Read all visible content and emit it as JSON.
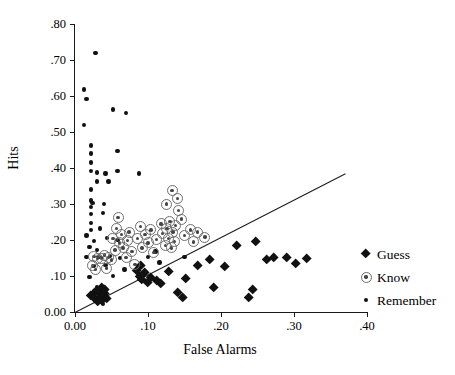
{
  "chart_data": {
    "type": "scatter",
    "title": "",
    "xlabel": "False Alarms",
    "ylabel": "Hits",
    "xlim": [
      0.0,
      0.4
    ],
    "ylim": [
      0.0,
      0.8
    ],
    "xticks": [
      0.0,
      0.1,
      0.2,
      0.3,
      0.4
    ],
    "xticklabels": [
      "0.00",
      ".10",
      ".20",
      ".30",
      ".40"
    ],
    "yticks": [
      0.0,
      0.1,
      0.2,
      0.3,
      0.4,
      0.5,
      0.6,
      0.7,
      0.8
    ],
    "yticklabels": [
      "0.00",
      ".10",
      ".20",
      ".30",
      ".40",
      ".50",
      ".60",
      ".70",
      ".80"
    ],
    "grid": false,
    "legend_position": "right",
    "reference_line": {
      "name": "identity-line",
      "x0": 0.0,
      "y0": 0.0,
      "x1": 0.37,
      "y1": 0.385
    },
    "series": [
      {
        "name": "Guess",
        "marker": "filled-diamond",
        "color": "#111111",
        "points": [
          [
            0.022,
            0.045
          ],
          [
            0.026,
            0.052
          ],
          [
            0.027,
            0.038
          ],
          [
            0.03,
            0.06
          ],
          [
            0.031,
            0.03
          ],
          [
            0.034,
            0.055
          ],
          [
            0.035,
            0.042
          ],
          [
            0.036,
            0.068
          ],
          [
            0.037,
            0.031
          ],
          [
            0.04,
            0.05
          ],
          [
            0.041,
            0.062
          ],
          [
            0.043,
            0.036
          ],
          [
            0.085,
            0.115
          ],
          [
            0.088,
            0.098
          ],
          [
            0.09,
            0.128
          ],
          [
            0.092,
            0.09
          ],
          [
            0.095,
            0.11
          ],
          [
            0.1,
            0.082
          ],
          [
            0.104,
            0.095
          ],
          [
            0.112,
            0.088
          ],
          [
            0.118,
            0.078
          ],
          [
            0.128,
            0.112
          ],
          [
            0.14,
            0.055
          ],
          [
            0.148,
            0.04
          ],
          [
            0.152,
            0.092
          ],
          [
            0.168,
            0.13
          ],
          [
            0.185,
            0.145
          ],
          [
            0.19,
            0.068
          ],
          [
            0.205,
            0.125
          ],
          [
            0.222,
            0.185
          ],
          [
            0.238,
            0.04
          ],
          [
            0.243,
            0.062
          ],
          [
            0.248,
            0.195
          ],
          [
            0.262,
            0.145
          ],
          [
            0.272,
            0.152
          ],
          [
            0.29,
            0.152
          ],
          [
            0.302,
            0.135
          ],
          [
            0.318,
            0.148
          ]
        ]
      },
      {
        "name": "Know",
        "marker": "circled-dot",
        "color": "#6e6e6e",
        "points": [
          [
            0.024,
            0.128
          ],
          [
            0.026,
            0.155
          ],
          [
            0.028,
            0.118
          ],
          [
            0.031,
            0.148
          ],
          [
            0.036,
            0.15
          ],
          [
            0.04,
            0.158
          ],
          [
            0.043,
            0.122
          ],
          [
            0.046,
            0.152
          ],
          [
            0.05,
            0.145
          ],
          [
            0.052,
            0.205
          ],
          [
            0.055,
            0.172
          ],
          [
            0.057,
            0.232
          ],
          [
            0.059,
            0.262
          ],
          [
            0.061,
            0.192
          ],
          [
            0.064,
            0.215
          ],
          [
            0.066,
            0.178
          ],
          [
            0.07,
            0.152
          ],
          [
            0.072,
            0.198
          ],
          [
            0.074,
            0.222
          ],
          [
            0.078,
            0.168
          ],
          [
            0.082,
            0.132
          ],
          [
            0.086,
            0.205
          ],
          [
            0.09,
            0.238
          ],
          [
            0.092,
            0.178
          ],
          [
            0.096,
            0.215
          ],
          [
            0.1,
            0.192
          ],
          [
            0.104,
            0.228
          ],
          [
            0.108,
            0.165
          ],
          [
            0.112,
            0.202
          ],
          [
            0.118,
            0.245
          ],
          [
            0.12,
            0.218
          ],
          [
            0.124,
            0.185
          ],
          [
            0.126,
            0.232
          ],
          [
            0.128,
            0.205
          ],
          [
            0.13,
            0.252
          ],
          [
            0.132,
            0.178
          ],
          [
            0.134,
            0.222
          ],
          [
            0.136,
            0.196
          ],
          [
            0.138,
            0.24
          ],
          [
            0.125,
            0.3
          ],
          [
            0.133,
            0.338
          ],
          [
            0.14,
            0.315
          ],
          [
            0.142,
            0.282
          ],
          [
            0.146,
            0.258
          ],
          [
            0.15,
            0.212
          ],
          [
            0.158,
            0.228
          ],
          [
            0.162,
            0.195
          ],
          [
            0.168,
            0.222
          ],
          [
            0.178,
            0.208
          ]
        ]
      },
      {
        "name": "Remember",
        "marker": "small-dot",
        "color": "#111111",
        "points": [
          [
            0.028,
            0.72
          ],
          [
            0.012,
            0.618
          ],
          [
            0.016,
            0.592
          ],
          [
            0.052,
            0.562
          ],
          [
            0.07,
            0.552
          ],
          [
            0.012,
            0.52
          ],
          [
            0.022,
            0.462
          ],
          [
            0.022,
            0.44
          ],
          [
            0.058,
            0.448
          ],
          [
            0.022,
            0.415
          ],
          [
            0.022,
            0.392
          ],
          [
            0.03,
            0.388
          ],
          [
            0.042,
            0.385
          ],
          [
            0.058,
            0.392
          ],
          [
            0.088,
            0.385
          ],
          [
            0.03,
            0.362
          ],
          [
            0.046,
            0.362
          ],
          [
            0.022,
            0.34
          ],
          [
            0.022,
            0.31
          ],
          [
            0.024,
            0.302
          ],
          [
            0.022,
            0.292
          ],
          [
            0.04,
            0.3
          ],
          [
            0.022,
            0.272
          ],
          [
            0.038,
            0.275
          ],
          [
            0.022,
            0.248
          ],
          [
            0.022,
            0.228
          ],
          [
            0.034,
            0.232
          ],
          [
            0.016,
            0.212
          ],
          [
            0.026,
            0.198
          ],
          [
            0.044,
            0.205
          ],
          [
            0.058,
            0.2
          ],
          [
            0.02,
            0.18
          ],
          [
            0.03,
            0.172
          ],
          [
            0.016,
            0.152
          ],
          [
            0.032,
            0.152
          ],
          [
            0.048,
            0.155
          ],
          [
            0.062,
            0.15
          ],
          [
            0.026,
            0.128
          ],
          [
            0.042,
            0.13
          ],
          [
            0.068,
            0.118
          ],
          [
            0.086,
            0.122
          ],
          [
            0.02,
            0.098
          ],
          [
            0.052,
            0.1
          ],
          [
            0.03,
            0.07
          ],
          [
            0.026,
            0.05
          ],
          [
            0.034,
            0.048
          ],
          [
            0.028,
            0.036
          ],
          [
            0.036,
            0.032
          ],
          [
            0.042,
            0.038
          ],
          [
            0.038,
            0.022
          ],
          [
            0.11,
            0.168
          ],
          [
            0.1,
            0.152
          ],
          [
            0.116,
            0.138
          ],
          [
            0.15,
            0.152
          ]
        ]
      }
    ]
  },
  "legend": {
    "items": [
      {
        "label": "Guess",
        "marker": "filled-diamond"
      },
      {
        "label": "Know",
        "marker": "circled-dot"
      },
      {
        "label": "Remember",
        "marker": "small-dot"
      }
    ]
  },
  "colors": {
    "axis": "#1a1a1a",
    "remember": "#111111",
    "guess": "#111111",
    "know_ring": "#6e6e6e",
    "know_core": "#444444",
    "background": "#ffffff"
  }
}
